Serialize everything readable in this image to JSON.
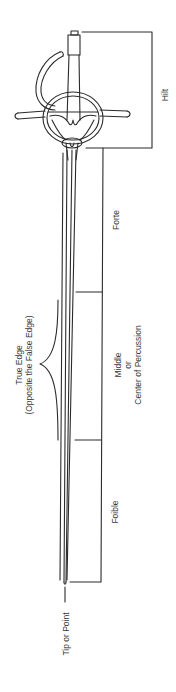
{
  "diagram": {
    "line_color": "#2b2b2b",
    "labels": {
      "hilt": "Hilt",
      "forte": "Forte",
      "middle": [
        "Middle",
        "or",
        "Center of Percussion"
      ],
      "foible": "Foible",
      "true_edge": [
        "True Edge",
        "(Opposite the False Edge)"
      ],
      "tip": "Tip or Point"
    }
  }
}
